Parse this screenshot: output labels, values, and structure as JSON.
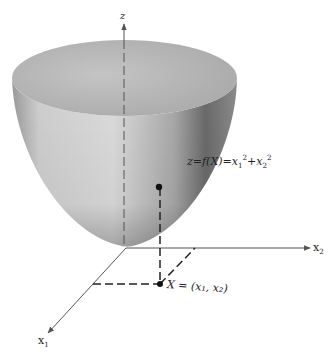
{
  "figure": {
    "type": "3d-surface-diagram",
    "surface": "paraboloid",
    "equation": {
      "lhs": "z=f(X)=",
      "term1_base": "x",
      "term1_sub": "1",
      "term1_sup": "2",
      "plus": "+",
      "term2_base": "x",
      "term2_sub": "2",
      "term2_sup": "2"
    },
    "axes": {
      "z": {
        "label": "z"
      },
      "x1": {
        "label_base": "x",
        "label_sub": "1"
      },
      "x2": {
        "label_base": "x",
        "label_sub": "2"
      }
    },
    "point_label": "X = (x₁, x₂)",
    "colors": {
      "surface_light": "#d9d9d9",
      "surface_dark": "#6e6e6e",
      "top_face": "#b9b9b9",
      "lines": "#333333",
      "text": "#222222"
    }
  }
}
